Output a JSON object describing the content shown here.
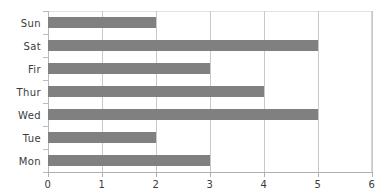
{
  "chart_data": {
    "type": "bar",
    "orientation": "horizontal",
    "title": "",
    "xlabel": "",
    "ylabel": "",
    "categories": [
      "Sun",
      "Sat",
      "Fir",
      "Thur",
      "Wed",
      "Tue",
      "Mon"
    ],
    "values": [
      2,
      5,
      3,
      4,
      5,
      2,
      3
    ],
    "xlim": [
      0,
      6
    ],
    "xticks": [
      0,
      1,
      2,
      3,
      4,
      5,
      6
    ],
    "xtick_labels": [
      "0",
      "1",
      "2",
      "3",
      "4",
      "5",
      "6"
    ],
    "grid": true,
    "grid_axis": "x",
    "legend": false,
    "bar_color": "#808080",
    "grid_color": "#c9c9c9",
    "axis_color": "#b0b0b0",
    "background_color": "#ffffff",
    "text_color": "#3b3b3b"
  }
}
